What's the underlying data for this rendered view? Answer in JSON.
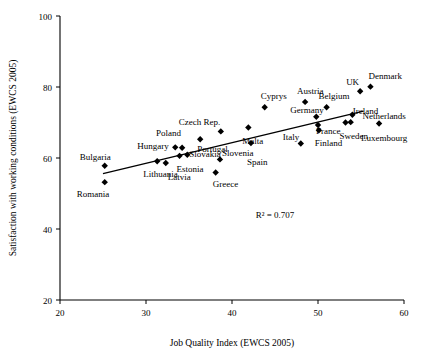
{
  "chart_data": {
    "type": "scatter",
    "title": "",
    "xlabel": "Job Quality Index (EWCS 2005)",
    "ylabel": "Satisfaction with working conditions (EWCS 2005)",
    "xlim": [
      20,
      60
    ],
    "ylim": [
      20,
      100
    ],
    "xticks": [
      20,
      30,
      40,
      50,
      60
    ],
    "yticks": [
      20,
      40,
      60,
      80,
      100
    ],
    "grid": false,
    "legend": null,
    "annotations": [
      {
        "text": "R² = 0.707",
        "x": 45.0,
        "y": 43.0
      }
    ],
    "trendline": {
      "x": [
        25.0,
        55.3
      ],
      "y": [
        55.6,
        73.2
      ]
    },
    "points": [
      {
        "label": "Romania",
        "x": 25.2,
        "y": 53.2,
        "label_dx": -28,
        "label_dy": 15
      },
      {
        "label": "Bulgaria",
        "x": 25.2,
        "y": 57.8,
        "label_dx": -25,
        "label_dy": -6
      },
      {
        "label": "Lithuania",
        "x": 31.3,
        "y": 59.1,
        "label_dx": -14,
        "label_dy": 16
      },
      {
        "label": "Latvia",
        "x": 32.3,
        "y": 58.6,
        "label_dx": 2,
        "label_dy": 17
      },
      {
        "label": "Hungary",
        "x": 33.4,
        "y": 63.0,
        "label_dx": -38,
        "label_dy": 2
      },
      {
        "label": "Poland",
        "x": 34.2,
        "y": 62.9,
        "label_dx": -26,
        "label_dy": -12
      },
      {
        "label": "Estonia",
        "x": 33.9,
        "y": 60.6,
        "label_dx": -3,
        "label_dy": 16
      },
      {
        "label": "Slovakia",
        "x": 34.8,
        "y": 60.9,
        "label_dx": 2,
        "label_dy": 2
      },
      {
        "label": "Greece",
        "x": 38.1,
        "y": 55.9,
        "label_dx": -3,
        "label_dy": 14
      },
      {
        "label": "Czech Rep.",
        "x": 38.7,
        "y": 67.5,
        "label_dx": -42,
        "label_dy": -6
      },
      {
        "label": "Portugal",
        "x": 36.3,
        "y": 65.3,
        "label_dx": -3,
        "label_dy": 13
      },
      {
        "label": "Slovenia",
        "x": 38.6,
        "y": 59.6,
        "label_dx": 2,
        "label_dy": -3
      },
      {
        "label": "Spain",
        "x": 42.2,
        "y": 64.2,
        "label_dx": -4,
        "label_dy": 22
      },
      {
        "label": "Malta",
        "x": 41.9,
        "y": 68.6,
        "label_dx": -6,
        "label_dy": 17
      },
      {
        "label": "Cyprys",
        "x": 43.8,
        "y": 74.3,
        "label_dx": -4,
        "label_dy": -8
      },
      {
        "label": "Italy",
        "x": 48.0,
        "y": 64.1,
        "label_dx": -18,
        "label_dy": -3
      },
      {
        "label": "Austria",
        "x": 48.5,
        "y": 75.8,
        "label_dx": -8,
        "label_dy": -8
      },
      {
        "label": "Germany",
        "x": 49.8,
        "y": 71.6,
        "label_dx": -26,
        "label_dy": -4
      },
      {
        "label": "Finland",
        "x": 50.1,
        "y": 67.8,
        "label_dx": -4,
        "label_dy": 16
      },
      {
        "label": "France",
        "x": 50.0,
        "y": 69.3,
        "label_dx": -2,
        "label_dy": 9
      },
      {
        "label": "Belgium",
        "x": 51.0,
        "y": 74.3,
        "label_dx": -8,
        "label_dy": -8
      },
      {
        "label": "Sweden",
        "x": 53.2,
        "y": 70.0,
        "label_dx": -6,
        "label_dy": 16
      },
      {
        "label": "Ireland",
        "x": 53.8,
        "y": 70.1,
        "label_dx": 2,
        "label_dy": -8
      },
      {
        "label": "UK",
        "x": 54.9,
        "y": 78.8,
        "label_dx": -14,
        "label_dy": -6
      },
      {
        "label": "Denmark",
        "x": 56.1,
        "y": 80.1,
        "label_dx": -2,
        "label_dy": -8
      },
      {
        "label": "Netherlands",
        "x": 54.0,
        "y": 72.2,
        "label_dx": 10,
        "label_dy": 4
      },
      {
        "label": "Luxembourg",
        "x": 57.1,
        "y": 69.7,
        "label_dx": -18,
        "label_dy": 17
      }
    ]
  }
}
